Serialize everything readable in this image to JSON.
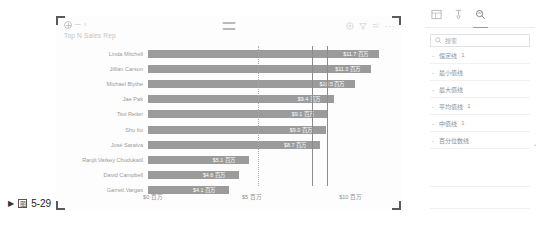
{
  "caption": {
    "arrow": "▶",
    "fig_glyph": "图",
    "text": "5-29"
  },
  "visual": {
    "title": "Top N Sales Rep",
    "header_icons": {
      "focus_mode": "focus-mode-icon",
      "filter": "filter-icon",
      "drill": "drill-icon",
      "more": "···",
      "add_visual": "add-circle-icon"
    }
  },
  "chart_data": {
    "type": "bar",
    "orientation": "horizontal",
    "title": "Top N Sales Rep",
    "xlabel": "",
    "ylabel": "",
    "xlim": [
      0,
      12.4
    ],
    "grid": false,
    "legend": null,
    "value_format": "$#.# 百万",
    "xticks": [
      {
        "value": 0,
        "label": "$0 百万"
      },
      {
        "value": 5,
        "label": "$5 百万"
      },
      {
        "value": 10,
        "label": "$10 百万"
      }
    ],
    "categories": [
      "Linda Mitchell",
      "Jillian Carson",
      "Michael Blythe",
      "Jae Pak",
      "Tsvi Reiter",
      "Shu Ito",
      "José Saraiva",
      "Ranjit Varkey Chudukatil",
      "David Campbell",
      "Garrett Vargas"
    ],
    "values": [
      11.7,
      11.3,
      10.5,
      9.4,
      9.1,
      9.0,
      8.7,
      5.1,
      4.6,
      4.1
    ],
    "data_labels": [
      "$11.7 百万",
      "$11.3 百万",
      "$10.5 百万",
      "$9.4 百万",
      "$9.1 百万",
      "$9.0 百万",
      "$8.7 百万",
      "$5.1 百万",
      "$4.6 百万",
      "$4.1 百万"
    ],
    "reference_lines": [
      {
        "name": "median-line",
        "value": 9.05,
        "style": "solid"
      },
      {
        "name": "average-line",
        "value": 8.3,
        "style": "solid"
      },
      {
        "name": "constant-line",
        "value": 5.55,
        "style": "dotted"
      }
    ]
  },
  "pane": {
    "tabs": [
      {
        "name": "fields-tab",
        "glyph": "▤",
        "active": false
      },
      {
        "name": "format-tab",
        "glyph": "✐",
        "active": false
      },
      {
        "name": "analytics-tab",
        "glyph": "⌕",
        "active": true
      }
    ],
    "search": {
      "placeholder": "搜索",
      "value": "",
      "icon": "search-icon"
    },
    "items": [
      {
        "label": "恒定线",
        "count": "1"
      },
      {
        "label": "最小值线",
        "count": ""
      },
      {
        "label": "最大值线",
        "count": ""
      },
      {
        "label": "平均值线",
        "count": "1"
      },
      {
        "label": "中值线",
        "count": "1"
      },
      {
        "label": "百分位数线",
        "count": ""
      }
    ]
  },
  "colors": {
    "bar": "#9b9b9b",
    "label_in_bar": "#ffffff",
    "label_out_bar": "#6d6d6d",
    "axis_text": "#8e8e8e",
    "refline_solid": "#8c8c8c",
    "refline_dotted": "#a9a9a9"
  }
}
